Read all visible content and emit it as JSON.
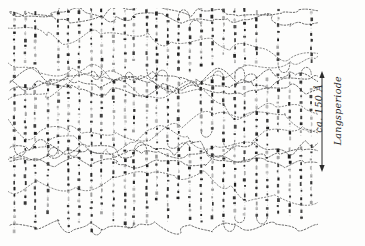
{
  "figure": {
    "kind": "hand-drawn scientific diagram",
    "background_color": "#fdfdfc",
    "ink_color": "#1d1d1d"
  },
  "annotations": {
    "long_period_value": "ca. 150 Å",
    "long_period_label": "Langsperiode"
  },
  "scale_bar": {
    "x": 322,
    "y_top": 75,
    "y_bottom": 168,
    "color": "#2b2b2b",
    "double_headed": true
  },
  "drawing_area": {
    "x": 12,
    "y": 12,
    "width": 303,
    "height": 220
  },
  "structure": {
    "lamella_bands": [
      {
        "top": 14,
        "bottom": 78
      },
      {
        "top": 86,
        "bottom": 150
      },
      {
        "top": 158,
        "bottom": 230
      }
    ],
    "stem_spacing_px": 11,
    "bead_spacing_px": 7,
    "note": "vertical dotted chain stems with dark beads; amorphous fold/tie regions between bands"
  }
}
